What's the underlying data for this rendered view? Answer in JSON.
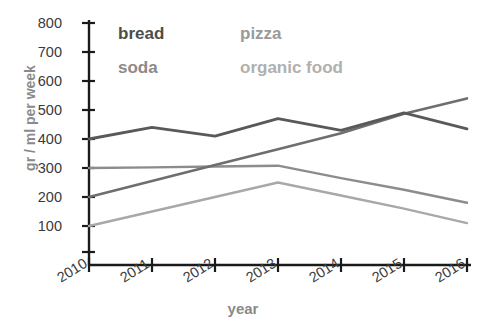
{
  "chart_data": {
    "type": "line",
    "title": "",
    "xlabel": "year",
    "ylabel": "gr / ml per week",
    "categories": [
      "2010",
      "2011",
      "2012",
      "2013",
      "2014",
      "2015",
      "2016"
    ],
    "x": [
      2010,
      2011,
      2012,
      2013,
      2014,
      2015,
      2016
    ],
    "ylim": [
      0,
      800
    ],
    "yticks": [
      100,
      200,
      300,
      400,
      500,
      600,
      700,
      800
    ],
    "grid": false,
    "legend_position": "inside-top-left",
    "series": [
      {
        "name": "bread",
        "color": "#595959",
        "values": [
          400,
          440,
          410,
          470,
          430,
          490,
          435
        ]
      },
      {
        "name": "pizza",
        "color": "#8c8c8c",
        "values": [
          300,
          302,
          305,
          308,
          265,
          225,
          180
        ]
      },
      {
        "name": "soda",
        "color": "#6e6e6e",
        "values": [
          200,
          255,
          310,
          365,
          420,
          487,
          540
        ]
      },
      {
        "name": "organic food",
        "color": "#a8a8a8",
        "values": [
          100,
          150,
          200,
          250,
          205,
          160,
          110
        ]
      }
    ]
  },
  "axes": {
    "y_label": "gr / ml per week",
    "x_label": "year",
    "y_tick_labels": [
      "800",
      "700",
      "600",
      "500",
      "400",
      "300",
      "200",
      "100"
    ],
    "x_tick_labels": [
      "2010",
      "2011",
      "2012",
      "2013",
      "2014",
      "2015",
      "2016"
    ]
  },
  "legend": {
    "items": [
      {
        "label": "bread",
        "color": "#4d4d4d"
      },
      {
        "label": "pizza",
        "color": "#9a9a9a"
      },
      {
        "label": "soda",
        "color": "#8a8a8a"
      },
      {
        "label": "organic food",
        "color": "#b0b0b0"
      }
    ]
  },
  "title": {
    "text": ""
  }
}
